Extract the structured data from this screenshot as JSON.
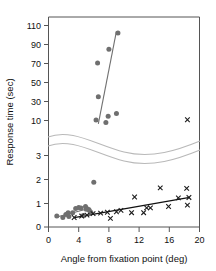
{
  "chart_data": {
    "type": "scatter",
    "title": "",
    "xlabel": "Angle from fixation point (deg)",
    "ylabel": "Response time (sec)",
    "xlim": [
      0,
      20
    ],
    "xticks": [
      0,
      4,
      8,
      12,
      16,
      20
    ],
    "axis_break": true,
    "upper_panel": {
      "ylim": [
        5,
        118
      ],
      "yticks": [
        10,
        30,
        50,
        70,
        90,
        110
      ]
    },
    "lower_panel": {
      "ylim": [
        0,
        3.3
      ],
      "yticks": [
        0,
        1,
        2,
        3
      ]
    },
    "grid": false,
    "legend": null,
    "series": [
      {
        "name": "upper-circles",
        "marker": "circle",
        "color": "#6f6f6f",
        "panel": "upper",
        "points": [
          {
            "x": 6.3,
            "y": 10.5
          },
          {
            "x": 6.5,
            "y": 70.5
          },
          {
            "x": 6.6,
            "y": 35.0
          },
          {
            "x": 7.6,
            "y": 8.0
          },
          {
            "x": 7.9,
            "y": 14.5
          },
          {
            "x": 8.0,
            "y": 85.0
          },
          {
            "x": 9.0,
            "y": 17.5
          },
          {
            "x": 9.2,
            "y": 102.0
          }
        ]
      },
      {
        "name": "upper-crosses",
        "marker": "x",
        "color": "#1b1b1b",
        "panel": "upper",
        "points": [
          {
            "x": 18.4,
            "y": 10.8
          }
        ]
      },
      {
        "name": "lower-circles",
        "marker": "circle",
        "color": "#6f6f6f",
        "panel": "lower",
        "points": [
          {
            "x": 1.1,
            "y": 0.46
          },
          {
            "x": 1.9,
            "y": 0.4
          },
          {
            "x": 2.3,
            "y": 0.52
          },
          {
            "x": 2.6,
            "y": 0.6
          },
          {
            "x": 2.7,
            "y": 0.44
          },
          {
            "x": 3.2,
            "y": 0.6
          },
          {
            "x": 3.6,
            "y": 0.78
          },
          {
            "x": 4.0,
            "y": 0.82
          },
          {
            "x": 4.3,
            "y": 0.8
          },
          {
            "x": 4.6,
            "y": 0.48
          },
          {
            "x": 4.9,
            "y": 0.86
          },
          {
            "x": 5.0,
            "y": 0.74
          },
          {
            "x": 5.2,
            "y": 0.76
          },
          {
            "x": 5.4,
            "y": 0.7
          },
          {
            "x": 5.6,
            "y": 0.62
          },
          {
            "x": 6.0,
            "y": 1.88
          }
        ]
      },
      {
        "name": "lower-crosses",
        "marker": "x",
        "color": "#1b1b1b",
        "panel": "lower",
        "points": [
          {
            "x": 3.4,
            "y": 0.4
          },
          {
            "x": 4.4,
            "y": 0.46
          },
          {
            "x": 5.1,
            "y": 0.5
          },
          {
            "x": 5.9,
            "y": 0.56
          },
          {
            "x": 6.9,
            "y": 0.58
          },
          {
            "x": 7.8,
            "y": 0.62
          },
          {
            "x": 8.2,
            "y": 0.36
          },
          {
            "x": 9.0,
            "y": 0.64
          },
          {
            "x": 9.6,
            "y": 0.7
          },
          {
            "x": 11.0,
            "y": 0.6
          },
          {
            "x": 11.4,
            "y": 1.26
          },
          {
            "x": 12.6,
            "y": 0.6
          },
          {
            "x": 13.0,
            "y": 0.8
          },
          {
            "x": 13.5,
            "y": 0.8
          },
          {
            "x": 14.8,
            "y": 1.64
          },
          {
            "x": 15.9,
            "y": 0.86
          },
          {
            "x": 17.2,
            "y": 1.22
          },
          {
            "x": 18.3,
            "y": 1.62
          },
          {
            "x": 18.4,
            "y": 0.92
          },
          {
            "x": 18.6,
            "y": 1.24
          }
        ]
      }
    ],
    "fits": [
      {
        "name": "upper-fit",
        "panel": "upper",
        "color": "#707070",
        "from": {
          "x": 6.6,
          "y": 6.5
        },
        "to": {
          "x": 9.0,
          "y": 104.0
        }
      },
      {
        "name": "lower-fit-circles",
        "panel": "lower",
        "color": "#707070",
        "from": {
          "x": 1.1,
          "y": 0.42
        },
        "to": {
          "x": 5.6,
          "y": 0.8
        }
      },
      {
        "name": "lower-fit-crosses",
        "panel": "lower",
        "color": "#111111",
        "from": {
          "x": 3.4,
          "y": 0.39
        },
        "to": {
          "x": 18.7,
          "y": 1.24
        }
      }
    ]
  },
  "axes": {
    "ylabel": "Response time (sec)",
    "xlabel": "Angle from fixation point (deg)",
    "y_upper_ticks": [
      "110",
      "90",
      "70",
      "50",
      "30",
      "10"
    ],
    "y_lower_ticks": [
      "3",
      "2",
      "1",
      "0"
    ],
    "x_ticks": [
      "0",
      "4",
      "8",
      "12",
      "16",
      "20"
    ]
  }
}
